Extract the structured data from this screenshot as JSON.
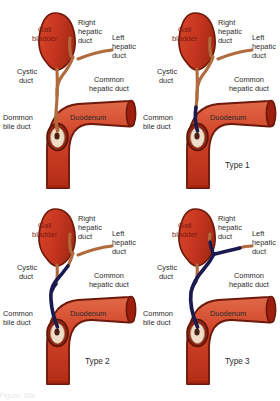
{
  "figure": {
    "background_color": "#ffffff",
    "bottom_caption": "Figure. Bile",
    "panels": [
      {
        "id": "panel-normal",
        "type_caption": "",
        "labels": {
          "gall_bladder": "Gall\nbladder",
          "right_hepatic_duct": "Right\nhepatic\nduct",
          "left_hepatic_duct": "Left\nhepatic\nduct",
          "cystic_duct": "Cystic\nduct",
          "common_hepatic_duct": "Common\nhepatic duct",
          "common_bile_duct": "Dommon\nbile duct",
          "duodenum": "Duodenum"
        },
        "abnormal_extent": "none"
      },
      {
        "id": "panel-type-1",
        "type_caption": "Type 1",
        "labels": {
          "gall_bladder": "Gall\nbladder",
          "right_hepatic_duct": "Right\nhepatic\nduct",
          "left_hepatic_duct": "Left\nhepatic\nduct",
          "cystic_duct": "Cystic\nduct",
          "common_hepatic_duct": "Common\nhepatic duct",
          "common_bile_duct": "Common\nbile duct",
          "duodenum": "Duodenum"
        },
        "abnormal_extent": "distal-common-bile-duct"
      },
      {
        "id": "panel-type-2",
        "type_caption": "Type 2",
        "labels": {
          "gall_bladder": "Gall\nbladder",
          "right_hepatic_duct": "Right\nhepatic\nduct",
          "left_hepatic_duct": "Left\nhepatic\nduct",
          "cystic_duct": "Cystic\nduct",
          "common_hepatic_duct": "Common\nhepatic duct",
          "common_bile_duct": "Common\nbile duct",
          "duodenum": "Duodenum"
        },
        "abnormal_extent": "common-bile-and-hepatic-duct"
      },
      {
        "id": "panel-type-3",
        "type_caption": "Type 3",
        "labels": {
          "gall_bladder": "Gall\nbladder",
          "right_hepatic_duct": "Right\nhepatic\nduct",
          "left_hepatic_duct": "Left\nhepatic\nduct",
          "cystic_duct": "Cystic\nduct",
          "common_hepatic_duct": "Common\nhepatic duct",
          "common_bile_duct": "Common\nbile duct",
          "duodenum": "Duodenum"
        },
        "abnormal_extent": "up-to-both-hepatic-branches"
      }
    ],
    "colors": {
      "organ_fill_light": "#e4593a",
      "organ_fill_dark": "#bd2f19",
      "organ_outline": "#6d1a0c",
      "duct_normal": "#b06a3c",
      "duct_abnormal": "#1a1a4e",
      "papilla_fill": "#f0ddc8",
      "papilla_center": "#4a2113",
      "label_text": "#2a2a2a",
      "organ_label_text": "#7c1b10"
    }
  }
}
